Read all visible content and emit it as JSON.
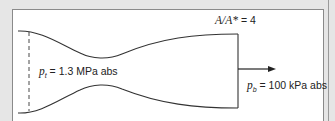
{
  "diagram": {
    "labels": {
      "area_ratio": {
        "symbol": "A/A*",
        "equals": " = 4"
      },
      "inlet_pressure": {
        "symbol": "p",
        "subscript": "t",
        "text": " = 1.3 MPa abs"
      },
      "back_pressure": {
        "symbol": "p",
        "subscript": "b",
        "text": " = 100 kPa abs"
      }
    },
    "colors": {
      "line": "#333333",
      "background": "#e6e6e6",
      "frame": "#ffffff"
    }
  }
}
